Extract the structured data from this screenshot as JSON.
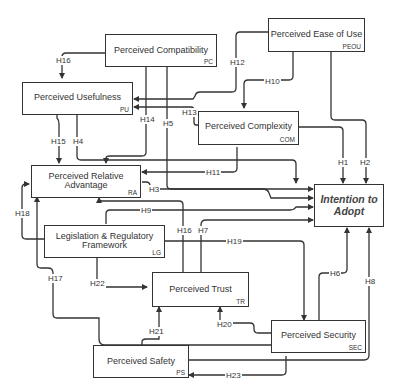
{
  "diagram": {
    "type": "research-model-path-diagram",
    "constructs": [
      {
        "id": "PC",
        "label": "Perceived Compatibility",
        "abbr": "PC"
      },
      {
        "id": "PEOU",
        "label": "Perceived Ease of Use",
        "abbr": "PEOU"
      },
      {
        "id": "PU",
        "label": "Perceived Usefulness",
        "abbr": "PU"
      },
      {
        "id": "COM",
        "label": "Perceived Complexity",
        "abbr": "COM"
      },
      {
        "id": "RA",
        "label_line1": "Perceived Relative",
        "label_line2": "Advantage",
        "abbr": "RA"
      },
      {
        "id": "ITA",
        "label_line1": "Intention to",
        "label_line2": "Adopt"
      },
      {
        "id": "LG",
        "label_line1": "Legislation & Regulatory",
        "label_line2": "Framework",
        "abbr": "LG"
      },
      {
        "id": "TR",
        "label": "Perceived Trust",
        "abbr": "TR"
      },
      {
        "id": "SEC",
        "label": "Perceived Security",
        "abbr": "SEC"
      },
      {
        "id": "PS",
        "label": "Perceived Safety",
        "abbr": "PS"
      }
    ],
    "hypotheses": [
      {
        "id": "H1",
        "from": "COM",
        "to": "ITA"
      },
      {
        "id": "H2",
        "from": "PEOU",
        "to": "ITA"
      },
      {
        "id": "H3",
        "from": "RA",
        "to": "ITA"
      },
      {
        "id": "H4",
        "from": "PU",
        "to": "ITA"
      },
      {
        "id": "H5",
        "from": "PC",
        "to": "ITA"
      },
      {
        "id": "H6",
        "from": "SEC",
        "to": "ITA"
      },
      {
        "id": "H7",
        "from": "TR",
        "to": "ITA"
      },
      {
        "id": "H8",
        "from": "PS",
        "to": "ITA"
      },
      {
        "id": "H9",
        "from": "LG",
        "to": "ITA"
      },
      {
        "id": "H10",
        "from": "PEOU",
        "to": "COM"
      },
      {
        "id": "H11",
        "from": "COM",
        "to": "RA"
      },
      {
        "id": "H12",
        "from": "PEOU",
        "to": "PU"
      },
      {
        "id": "H13",
        "from": "COM",
        "to": "PU"
      },
      {
        "id": "H14",
        "from": "PC",
        "to": "RA"
      },
      {
        "id": "H15",
        "from": "PU",
        "to": "RA"
      },
      {
        "id": "H16",
        "from": "TR",
        "to": "RA"
      },
      {
        "id": "H17",
        "from": "SEC",
        "to": "RA"
      },
      {
        "id": "H18",
        "from": "LG",
        "to": "RA"
      },
      {
        "id": "H19",
        "from": "LG",
        "to": "SEC"
      },
      {
        "id": "H20",
        "from": "SEC",
        "to": "TR"
      },
      {
        "id": "H21",
        "from": "PS",
        "to": "TR"
      },
      {
        "id": "H22",
        "from": "LG",
        "to": "TR"
      },
      {
        "id": "H23",
        "from": "SEC",
        "to": "PS"
      }
    ]
  },
  "labels": {
    "H1": "H1",
    "H2": "H2",
    "H3": "H3",
    "H4": "H4",
    "H5": "H5",
    "H6": "H6",
    "H7": "H7",
    "H8": "H8",
    "H9": "H9",
    "H10": "H10",
    "H11": "H11",
    "H12": "H12",
    "H13": "H13",
    "H14": "H14",
    "H15": "H15",
    "H16": "H16",
    "H17": "H17",
    "H18": "H18",
    "H19": "H19",
    "H20": "H20",
    "H21": "H21",
    "H22": "H22",
    "H23": "H23"
  }
}
